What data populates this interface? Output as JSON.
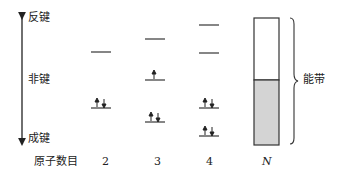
{
  "axis": {
    "top_label": "反键",
    "middle_label": "非键",
    "bottom_label": "成键"
  },
  "x_axis_label": "原子数目",
  "columns": [
    {
      "atoms": "2",
      "levels": [
        {
          "y": 52,
          "electrons": 0
        },
        {
          "y": 108,
          "electrons": 2
        }
      ]
    },
    {
      "atoms": "3",
      "levels": [
        {
          "y": 39,
          "electrons": 0
        },
        {
          "y": 80,
          "electrons": 1
        },
        {
          "y": 122,
          "electrons": 2
        }
      ]
    },
    {
      "atoms": "4",
      "levels": [
        {
          "y": 25,
          "electrons": 0
        },
        {
          "y": 53,
          "electrons": 0
        },
        {
          "y": 108,
          "electrons": 2
        },
        {
          "y": 136,
          "electrons": 2
        }
      ]
    },
    {
      "atoms": "N",
      "band": {
        "empty_fraction": 0.49,
        "filled_fraction": 0.51
      }
    }
  ],
  "band_label": "能带",
  "colors": {
    "line": "#333333",
    "band_fill": "#d4d4d4"
  }
}
